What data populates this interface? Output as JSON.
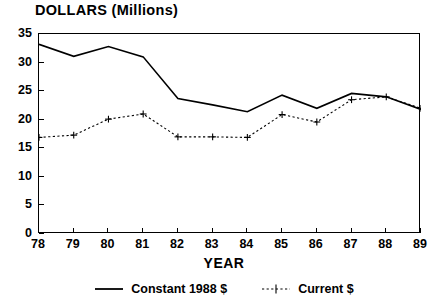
{
  "chart_data": {
    "type": "line",
    "title": "DOLLARS (Millions)",
    "xlabel": "YEAR",
    "ylabel": "",
    "categories": [
      "78",
      "79",
      "80",
      "81",
      "82",
      "83",
      "84",
      "85",
      "86",
      "87",
      "88",
      "89"
    ],
    "x": [
      78,
      79,
      80,
      81,
      82,
      83,
      84,
      85,
      86,
      87,
      88,
      89
    ],
    "xlim": [
      78,
      89
    ],
    "ylim": [
      0,
      35
    ],
    "yticks": [
      0,
      5,
      10,
      15,
      20,
      25,
      30,
      35
    ],
    "ytick_labels": [
      "0",
      "5",
      "10",
      "15",
      "20",
      "25",
      "30",
      "35"
    ],
    "xtick_labels": [
      "78",
      "79",
      "80",
      "81",
      "82",
      "83",
      "84",
      "85",
      "86",
      "87",
      "88",
      "89"
    ],
    "grid": false,
    "legend_position": "bottom",
    "series": [
      {
        "name": "Constant 1988 $",
        "style": "solid",
        "marker": "none",
        "color": "#000000",
        "values": [
          33.2,
          31.1,
          32.8,
          31.0,
          23.7,
          22.6,
          21.4,
          24.3,
          22.0,
          24.6,
          24.0,
          21.8
        ]
      },
      {
        "name": "Current $",
        "style": "dotted",
        "marker": "plus",
        "color": "#000000",
        "values": [
          16.9,
          17.3,
          20.1,
          21.0,
          17.0,
          17.0,
          16.9,
          20.9,
          19.6,
          23.5,
          24.0,
          22.0
        ]
      }
    ]
  },
  "legend": {
    "items": [
      {
        "label": "Constant 1988 $",
        "swatch": "solid-line-swatch"
      },
      {
        "label": "Current $",
        "swatch": "dotted-plus-swatch"
      }
    ]
  },
  "colors": {
    "ink": "#000000",
    "background": "#ffffff"
  }
}
